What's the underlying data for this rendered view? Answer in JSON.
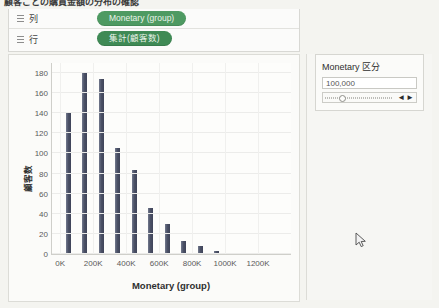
{
  "window": {
    "title_strip": "顧客ごとの購買金額の分布の確認"
  },
  "shelves": [
    {
      "icon": "grid-icon",
      "label": "列",
      "pill": "Monetary (group)"
    },
    {
      "icon": "grid-icon",
      "label": "行",
      "pill": "集計(顧客数)"
    }
  ],
  "filter_card": {
    "title": "Monetary 区分",
    "value": "100,000",
    "slider_position_pct": 25,
    "prev_arrow": "◄",
    "next_arrow": "►"
  },
  "chart_data": {
    "type": "bar",
    "title": "",
    "xlabel": "Monetary (group)",
    "ylabel": "顧客数",
    "xlim": [
      -50000,
      1400000
    ],
    "ylim": [
      0,
      190
    ],
    "ytick_values": [
      0,
      20,
      40,
      60,
      80,
      100,
      120,
      140,
      160,
      180
    ],
    "ytick_labels": [
      "0",
      "20",
      "40",
      "60",
      "80",
      "100",
      "120",
      "140",
      "160",
      "180"
    ],
    "xtick_values": [
      0,
      200000,
      400000,
      600000,
      800000,
      1000000,
      1200000
    ],
    "xtick_labels": [
      "0K",
      "200K",
      "400K",
      "600K",
      "800K",
      "1000K",
      "1200K"
    ],
    "bin_width": 100000,
    "grid": true,
    "legend": "none",
    "bar_color": "#4b5166",
    "categories": [
      0,
      100000,
      200000,
      300000,
      400000,
      500000,
      600000,
      700000,
      800000,
      900000,
      1000000,
      1100000,
      1200000,
      1300000
    ],
    "values": [
      140,
      181,
      174,
      105,
      84,
      46,
      30,
      13,
      8,
      3,
      1,
      1,
      1,
      1
    ]
  }
}
